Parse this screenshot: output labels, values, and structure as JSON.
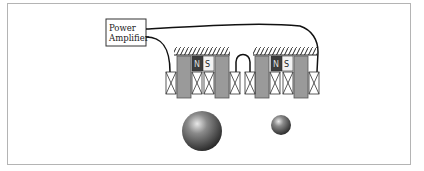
{
  "diagram": {
    "amplifier": {
      "line1": "Power",
      "line2": "Amplifier"
    },
    "magnets": [
      {
        "north": "N",
        "south": "S"
      },
      {
        "north": "N",
        "south": "S"
      }
    ],
    "colors": {
      "pole": "#9a9a9a",
      "north": "#3c3c3c",
      "south": "#f2f2f2",
      "wire": "#111111",
      "frame": "#b4b4b4"
    },
    "balls": [
      {
        "size": "large"
      },
      {
        "size": "small"
      }
    ]
  }
}
